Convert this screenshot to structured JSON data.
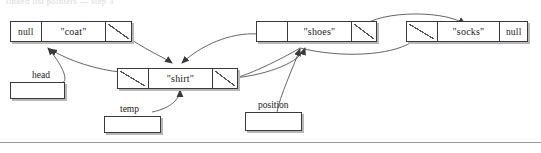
{
  "diagram": {
    "title_clipped": "linked list pointers — step 3",
    "nodes": [
      {
        "id": "coat",
        "prev_label": "null",
        "value": "\"coat\"",
        "next_label": ""
      },
      {
        "id": "shirt",
        "prev_label": "",
        "value": "\"shirt\"",
        "next_label": ""
      },
      {
        "id": "shoes",
        "prev_label": "",
        "value": "\"shoes\"",
        "next_label": ""
      },
      {
        "id": "socks",
        "prev_label": "",
        "value": "\"socks\"",
        "next_label": "null"
      }
    ],
    "variables": [
      {
        "id": "head",
        "label": "head",
        "value": ""
      },
      {
        "id": "temp",
        "label": "temp",
        "value": ""
      },
      {
        "id": "position",
        "label": "position",
        "value": ""
      }
    ],
    "colors": {
      "stroke": "#3a3a3a",
      "shadow": "#b8b8b8",
      "arrow": "#555555",
      "text": "#1a1a1a",
      "rule": "#9a9a9a",
      "background": "#ffffff"
    }
  }
}
